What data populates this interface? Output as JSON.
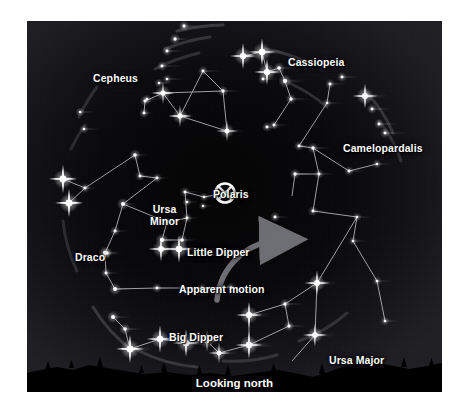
{
  "figure": {
    "kind": "star-chart",
    "orientation_caption": "Looking north",
    "background_color": "#0b0b0e",
    "star_color": "#ffffff",
    "line_color": "#c8c8cf",
    "label_color": "#ffffff",
    "horizon_color": "#000000",
    "panel": {
      "x": 27,
      "y": 21,
      "width": 415,
      "height": 371
    }
  },
  "labels": {
    "cepheus": "Cepheus",
    "cassiopeia": "Cassiopeia",
    "camelopardalis": "Camelopardalis",
    "polaris": "Polaris",
    "ursa_minor_line1": "Ursa",
    "ursa_minor_line2": "Minor",
    "little_dipper": "Little Dipper",
    "draco": "Draco",
    "apparent_motion": "Apparent motion",
    "big_dipper": "Big Dipper",
    "ursa_major": "Ursa Major",
    "looking_north": "Looking north"
  },
  "label_positions": {
    "cepheus": {
      "x": 66,
      "y": 52
    },
    "cassiopeia": {
      "x": 261,
      "y": 36
    },
    "camelopardalis": {
      "x": 316,
      "y": 122
    },
    "polaris": {
      "x": 186,
      "y": 168
    },
    "ursa_minor": {
      "x": 123,
      "y": 183
    },
    "little_dipper": {
      "x": 160,
      "y": 226
    },
    "draco": {
      "x": 48,
      "y": 231
    },
    "apparent_motion": {
      "x": 152,
      "y": 263
    },
    "big_dipper": {
      "x": 142,
      "y": 311
    },
    "ursa_major": {
      "x": 302,
      "y": 334
    }
  },
  "chart_data": {
    "type": "scatter",
    "subtitle": "Looking north",
    "constellations": [
      {
        "name": "Cepheus",
        "label": "Cepheus"
      },
      {
        "name": "Cassiopeia",
        "label": "Cassiopeia"
      },
      {
        "name": "Camelopardalis",
        "label": "Camelopardalis"
      },
      {
        "name": "Ursa Minor",
        "label": "Ursa Minor"
      },
      {
        "name": "Draco",
        "label": "Draco"
      },
      {
        "name": "Ursa Major",
        "label": "Ursa Major"
      }
    ],
    "asterisms": [
      {
        "name": "Little Dipper",
        "parent": "Ursa Minor"
      },
      {
        "name": "Big Dipper",
        "parent": "Ursa Major"
      }
    ],
    "pole_star": {
      "name": "Polaris",
      "marker": "crosshair-circle",
      "x": 198,
      "y": 172
    },
    "annotations": [
      {
        "name": "apparent-motion-arrow",
        "text": "Apparent motion",
        "direction": "counterclockwise about Polaris"
      }
    ],
    "stars": [
      {
        "x": 157,
        "y": 5,
        "mag": 2.0,
        "trail": 16
      },
      {
        "x": 148,
        "y": 18,
        "mag": 2.0,
        "trail": 16
      },
      {
        "x": 140,
        "y": 30,
        "mag": 1.8,
        "trail": 18
      },
      {
        "x": 135,
        "y": 45,
        "mag": 1.8,
        "trail": 20
      },
      {
        "x": 140,
        "y": 58,
        "mag": 1.6,
        "trail": 18
      },
      {
        "x": 132,
        "y": 62,
        "mag": 1.6,
        "trail": 15
      },
      {
        "x": 120,
        "y": 78,
        "mag": 1.6,
        "trail": 14
      },
      {
        "x": 53,
        "y": 91,
        "mag": 1.6,
        "trail": 16
      },
      {
        "x": 57,
        "y": 108,
        "mag": 1.6,
        "trail": 16
      },
      {
        "x": 136,
        "y": 72,
        "mag": 3.2,
        "trail": 12
      },
      {
        "x": 153,
        "y": 95,
        "mag": 3.2,
        "trail": 14
      },
      {
        "x": 118,
        "y": 80,
        "mag": 1.8,
        "trail": 12
      },
      {
        "x": 117,
        "y": 92,
        "mag": 1.8,
        "trail": 10
      },
      {
        "x": 176,
        "y": 50,
        "mag": 1.8,
        "trail": 18
      },
      {
        "x": 196,
        "y": 70,
        "mag": 2.0,
        "trail": 18
      },
      {
        "x": 200,
        "y": 110,
        "mag": 3.0,
        "trail": 16
      },
      {
        "x": 236,
        "y": 58,
        "mag": 1.8,
        "trail": 14
      },
      {
        "x": 216,
        "y": 35,
        "mag": 3.8,
        "trail": 20
      },
      {
        "x": 235,
        "y": 31,
        "mag": 4.0,
        "trail": 22
      },
      {
        "x": 240,
        "y": 51,
        "mag": 3.8,
        "trail": 20
      },
      {
        "x": 252,
        "y": 47,
        "mag": 2.2,
        "trail": 18
      },
      {
        "x": 258,
        "y": 60,
        "mag": 2.6,
        "trail": 20
      },
      {
        "x": 264,
        "y": 78,
        "mag": 2.0,
        "trail": 18
      },
      {
        "x": 247,
        "y": 104,
        "mag": 1.8,
        "trail": 16
      },
      {
        "x": 240,
        "y": 106,
        "mag": 1.8,
        "trail": 16
      },
      {
        "x": 303,
        "y": 63,
        "mag": 1.8,
        "trail": 16
      },
      {
        "x": 315,
        "y": 56,
        "mag": 1.8,
        "trail": 18
      },
      {
        "x": 338,
        "y": 75,
        "mag": 3.6,
        "trail": 22
      },
      {
        "x": 345,
        "y": 88,
        "mag": 1.8,
        "trail": 20
      },
      {
        "x": 352,
        "y": 103,
        "mag": 1.8,
        "trail": 20
      },
      {
        "x": 358,
        "y": 112,
        "mag": 1.8,
        "trail": 20
      },
      {
        "x": 300,
        "y": 82,
        "mag": 1.6,
        "trail": 14
      },
      {
        "x": 272,
        "y": 125,
        "mag": 1.8,
        "trail": 16
      },
      {
        "x": 286,
        "y": 127,
        "mag": 2.0,
        "trail": 18
      },
      {
        "x": 268,
        "y": 153,
        "mag": 2.0,
        "trail": 18
      },
      {
        "x": 292,
        "y": 153,
        "mag": 1.8,
        "trail": 16
      },
      {
        "x": 322,
        "y": 150,
        "mag": 1.8,
        "trail": 16
      },
      {
        "x": 350,
        "y": 143,
        "mag": 1.6,
        "trail": 14
      },
      {
        "x": 286,
        "y": 190,
        "mag": 1.8,
        "trail": 16
      },
      {
        "x": 248,
        "y": 196,
        "mag": 1.8,
        "trail": 14
      },
      {
        "x": 330,
        "y": 196,
        "mag": 1.6,
        "trail": 14
      },
      {
        "x": 326,
        "y": 220,
        "mag": 1.6,
        "trail": 14
      },
      {
        "x": 350,
        "y": 260,
        "mag": 1.6,
        "trail": 14
      },
      {
        "x": 358,
        "y": 300,
        "mag": 1.6,
        "trail": 14
      },
      {
        "x": 108,
        "y": 134,
        "mag": 2.2,
        "trail": 14
      },
      {
        "x": 113,
        "y": 155,
        "mag": 1.8,
        "trail": 14
      },
      {
        "x": 130,
        "y": 157,
        "mag": 1.8,
        "trail": 12
      },
      {
        "x": 36,
        "y": 158,
        "mag": 4.2,
        "trail": 14
      },
      {
        "x": 42,
        "y": 182,
        "mag": 4.2,
        "trail": 14
      },
      {
        "x": 58,
        "y": 167,
        "mag": 1.8,
        "trail": 12
      },
      {
        "x": 96,
        "y": 183,
        "mag": 2.4,
        "trail": 14
      },
      {
        "x": 88,
        "y": 210,
        "mag": 1.8,
        "trail": 14
      },
      {
        "x": 78,
        "y": 232,
        "mag": 2.6,
        "trail": 16
      },
      {
        "x": 80,
        "y": 232,
        "mag": 2.0,
        "trail": 12
      },
      {
        "x": 79,
        "y": 252,
        "mag": 1.8,
        "trail": 14
      },
      {
        "x": 88,
        "y": 268,
        "mag": 2.4,
        "trail": 16
      },
      {
        "x": 130,
        "y": 267,
        "mag": 1.8,
        "trail": 14
      },
      {
        "x": 175,
        "y": 267,
        "mag": 1.8,
        "trail": 18
      },
      {
        "x": 204,
        "y": 266,
        "mag": 1.6,
        "trail": 14
      },
      {
        "x": 158,
        "y": 171,
        "mag": 1.8,
        "trail": 14
      },
      {
        "x": 177,
        "y": 176,
        "mag": 1.6,
        "trail": 12
      },
      {
        "x": 176,
        "y": 185,
        "mag": 1.4,
        "trail": 10
      },
      {
        "x": 160,
        "y": 181,
        "mag": 1.6,
        "trail": 12
      },
      {
        "x": 160,
        "y": 197,
        "mag": 1.8,
        "trail": 12
      },
      {
        "x": 140,
        "y": 201,
        "mag": 1.8,
        "trail": 12
      },
      {
        "x": 135,
        "y": 219,
        "mag": 2.6,
        "trail": 14
      },
      {
        "x": 155,
        "y": 219,
        "mag": 2.2,
        "trail": 14
      },
      {
        "x": 134,
        "y": 228,
        "mag": 3.6,
        "trail": 18
      },
      {
        "x": 152,
        "y": 228,
        "mag": 4.0,
        "trail": 20
      },
      {
        "x": 86,
        "y": 296,
        "mag": 2.4,
        "trail": 18
      },
      {
        "x": 98,
        "y": 308,
        "mag": 2.2,
        "trail": 18
      },
      {
        "x": 103,
        "y": 328,
        "mag": 4.2,
        "trail": 22
      },
      {
        "x": 133,
        "y": 318,
        "mag": 4.0,
        "trail": 24
      },
      {
        "x": 159,
        "y": 322,
        "mag": 4.0,
        "trail": 24
      },
      {
        "x": 180,
        "y": 320,
        "mag": 3.0,
        "trail": 20
      },
      {
        "x": 192,
        "y": 332,
        "mag": 3.0,
        "trail": 20
      },
      {
        "x": 222,
        "y": 324,
        "mag": 4.0,
        "trail": 24
      },
      {
        "x": 222,
        "y": 294,
        "mag": 3.8,
        "trail": 22
      },
      {
        "x": 258,
        "y": 283,
        "mag": 2.0,
        "trail": 18
      },
      {
        "x": 262,
        "y": 305,
        "mag": 2.0,
        "trail": 18
      },
      {
        "x": 290,
        "y": 262,
        "mag": 3.6,
        "trail": 20
      },
      {
        "x": 288,
        "y": 314,
        "mag": 3.4,
        "trail": 20
      }
    ]
  }
}
